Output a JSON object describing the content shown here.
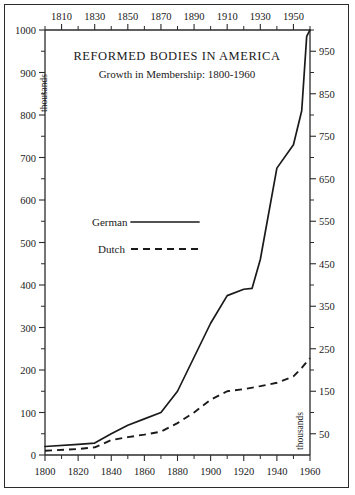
{
  "chart_data": {
    "type": "line",
    "title": "REFORMED BODIES IN AMERICA",
    "subtitle": "Growth in Membership: 1800-1960",
    "xlabel": "",
    "ylabel": "thousands",
    "ylabel_right": "thousands",
    "xlim": [
      1800,
      1960
    ],
    "ylim": [
      0,
      1000
    ],
    "grid": false,
    "legend_position": "center-left",
    "x_ticks_bottom": [
      1800,
      1820,
      1840,
      1860,
      1880,
      1900,
      1920,
      1940,
      1960
    ],
    "x_ticks_bottom_minor": [
      1810,
      1830,
      1850,
      1870,
      1890,
      1910,
      1930,
      1950
    ],
    "x_ticks_top": [
      1810,
      1830,
      1850,
      1870,
      1890,
      1910,
      1930,
      1950
    ],
    "x_ticks_top_minor": [
      1800,
      1820,
      1840,
      1860,
      1880,
      1900,
      1920,
      1940,
      1960
    ],
    "y_ticks_left": [
      0,
      100,
      200,
      300,
      400,
      500,
      600,
      700,
      800,
      900,
      1000
    ],
    "y_ticks_left_minor": [
      50,
      150,
      250,
      350,
      450,
      550,
      650,
      750,
      850,
      950
    ],
    "y_ticks_right": [
      50,
      150,
      250,
      350,
      450,
      550,
      650,
      750,
      850,
      950
    ],
    "y_ticks_right_minor": [
      100,
      200,
      300,
      400,
      500,
      600,
      700,
      800,
      900,
      1000
    ],
    "series": [
      {
        "name": "German",
        "style": "solid",
        "x": [
          1800,
          1820,
          1830,
          1840,
          1850,
          1860,
          1870,
          1880,
          1890,
          1900,
          1910,
          1920,
          1925,
          1930,
          1940,
          1950,
          1955,
          1958,
          1960
        ],
        "values": [
          20,
          25,
          28,
          50,
          70,
          85,
          100,
          150,
          230,
          310,
          375,
          390,
          392,
          460,
          675,
          730,
          810,
          985,
          1000
        ]
      },
      {
        "name": "Dutch",
        "style": "dashed",
        "x": [
          1800,
          1820,
          1830,
          1840,
          1850,
          1860,
          1870,
          1880,
          1890,
          1900,
          1910,
          1920,
          1930,
          1940,
          1950,
          1955,
          1960
        ],
        "values": [
          10,
          14,
          18,
          35,
          42,
          48,
          55,
          75,
          100,
          130,
          150,
          155,
          162,
          170,
          185,
          205,
          228
        ]
      }
    ]
  },
  "title": {
    "main": "REFORMED BODIES IN AMERICA",
    "sub": "Growth in Membership: 1800-1960"
  },
  "axes": {
    "left_label": "thousands",
    "right_label": "thousands"
  },
  "legend": {
    "items": [
      {
        "label": "German",
        "style": "solid"
      },
      {
        "label": "Dutch",
        "style": "dashed"
      }
    ]
  }
}
